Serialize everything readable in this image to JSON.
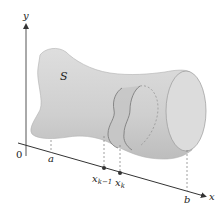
{
  "figure": {
    "solid_label": "S",
    "axes": {
      "y_label": "y",
      "x_label": "x",
      "origin_label": "0"
    },
    "points": {
      "a": "a",
      "x_k_minus_1_base": "x",
      "x_k_minus_1_sub": "k−1",
      "x_k_base": "x",
      "x_k_sub": "k",
      "b": "b"
    },
    "colors": {
      "solid_fill": "#d6d6d6",
      "solid_shade": "#c4c4c4",
      "slab_fill": "#c8c8c8",
      "end_cap": "#dcdcdc",
      "outline": "#8a8a8a",
      "axis": "#333333"
    }
  }
}
